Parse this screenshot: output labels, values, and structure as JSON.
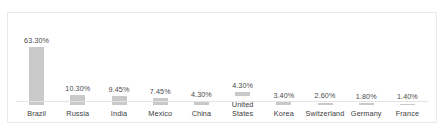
{
  "chart_data": {
    "type": "bar",
    "title": "",
    "subtitle": "",
    "xlabel": "",
    "ylabel": "",
    "grid": false,
    "legend": "none",
    "ylim": [
      0,
      70
    ],
    "categories": [
      "Brazil",
      "Russia",
      "India",
      "Mexico",
      "China",
      "United\nStates",
      "Korea",
      "Switzerland",
      "Germany",
      "France"
    ],
    "values": [
      63.3,
      10.3,
      9.45,
      7.45,
      4.3,
      4.3,
      3.4,
      2.6,
      1.8,
      1.4
    ],
    "value_labels": [
      "63.30%",
      "10.30%",
      "9.45%",
      "7.45%",
      "4.30%",
      "4.30%",
      "3.40%",
      "2.60%",
      "1.80%",
      "1.40%"
    ],
    "bar_color": "#c9c9c9",
    "axis_color": "#e4e4e4",
    "label_color": "#3d3d3d",
    "value_color": "#4a4a4a",
    "background": "#ffffff",
    "border_color": "#e9e9e9"
  }
}
